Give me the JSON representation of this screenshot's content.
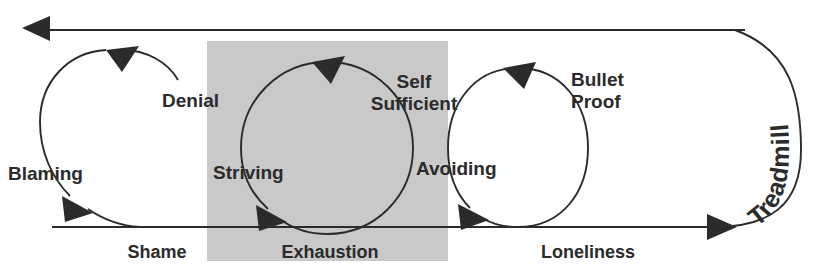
{
  "diagram": {
    "title": "Treadmill",
    "shaded_region": {
      "name": "exhaustion-zone",
      "color": "#c9c9c9",
      "x": 207,
      "y": 41,
      "width": 241,
      "height": 220
    },
    "outer_loop": {
      "label": "Treadmill",
      "direction": "clockwise",
      "description": "Outer return path running right along the bottom, up the rounded right edge, and back left along the top"
    },
    "cycles": [
      {
        "id": "denial-blaming",
        "cycle_labels": [
          "Denial",
          "Blaming"
        ],
        "stage_label": "Shame",
        "shaded": false,
        "cx": 108,
        "cy": 148,
        "r": 70,
        "open_arc": true
      },
      {
        "id": "self-sufficient-striving",
        "cycle_labels": [
          "Self Sufficient",
          "Striving"
        ],
        "stage_label": "Exhaustion",
        "shaded": true,
        "cx": 327,
        "cy": 148,
        "r": 86,
        "open_arc": false
      },
      {
        "id": "bullet-proof-avoiding",
        "cycle_labels": [
          "Bullet Proof",
          "Avoiding"
        ],
        "stage_label": "Loneliness",
        "shaded": false,
        "cx": 518,
        "cy": 148,
        "r": 70,
        "open_arc": false
      }
    ],
    "cycle_labels": {
      "denial": "Denial",
      "blaming": "Blaming",
      "self_sufficient_line1": "Self",
      "self_sufficient_line2": "Sufficient",
      "striving": "Striving",
      "bullet_proof_line1": "Bullet",
      "bullet_proof_line2": "Proof",
      "avoiding": "Avoiding"
    },
    "stage_labels": {
      "shame": "Shame",
      "exhaustion": "Exhaustion",
      "loneliness": "Loneliness"
    },
    "colors": {
      "ink": "#2b2b2b",
      "shade": "#c9c9c9",
      "background": "#ffffff"
    }
  }
}
